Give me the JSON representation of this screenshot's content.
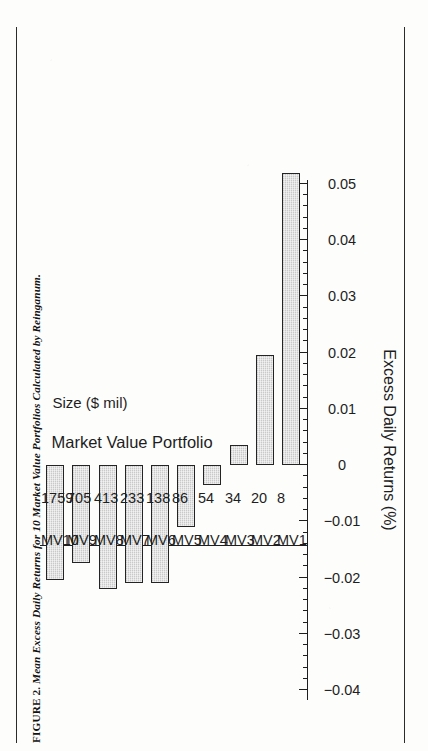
{
  "figure": {
    "caption_number": "FIGURE 2.",
    "caption_text": "Mean Excess Daily Returns for 10 Market Value Portfolios Calculated by Reinganum.",
    "caption_full": "FIGURE 2. Mean Excess Daily Returns for 10 Market Value Portfolios Calculated by Reinganum.",
    "orientation": "rotated-90-ccw",
    "page_rules_color": "#2b2b2b"
  },
  "axes": {
    "value_axis_title": "Excess Daily Returns (%)",
    "category_axis_title": "Market Value Portfolio",
    "size_row_title": "Size ($ mil)",
    "value_tick_labels": [
      "0.05",
      "0.04",
      "0.03",
      "0.02",
      "0.01",
      "0",
      "-0.01",
      "-0.02",
      "-0.03",
      "-0.04"
    ],
    "value_tick_values": [
      0.05,
      0.04,
      0.03,
      0.02,
      0.01,
      0,
      -0.01,
      -0.02,
      -0.03,
      -0.04
    ],
    "minor_ticks_per_interval": 4,
    "bar_fill": "#c9c9c9",
    "bar_stroke": "#242424"
  },
  "chart_data": {
    "type": "bar",
    "title": "Mean Excess Daily Returns for 10 Market Value Portfolios Calculated by Reinganum.",
    "xlabel": "Market Value Portfolio",
    "ylabel": "Excess Daily Returns (%)",
    "orientation": "vertical-rendered-rotated",
    "grid": false,
    "legend": "none",
    "ylim": [
      -0.04,
      0.05
    ],
    "yticks": [
      -0.04,
      -0.03,
      -0.02,
      -0.01,
      0,
      0.01,
      0.02,
      0.03,
      0.04,
      0.05
    ],
    "categories": [
      "MV1",
      "MV2",
      "MV3",
      "MV4",
      "MV5",
      "MV6",
      "MV7",
      "MV8",
      "MV9",
      "MV10"
    ],
    "secondary_axis_label": "Size ($ mil)",
    "secondary_categories": [
      "8",
      "20",
      "34",
      "54",
      "86",
      "138",
      "233",
      "413",
      "705",
      "1759"
    ],
    "secondary_values": [
      8,
      20,
      34,
      54,
      86,
      138,
      233,
      413,
      705,
      1759
    ],
    "values": [
      0.052,
      0.0195,
      0.0035,
      -0.0035,
      -0.011,
      -0.021,
      -0.021,
      -0.022,
      -0.0175,
      -0.0205
    ]
  }
}
